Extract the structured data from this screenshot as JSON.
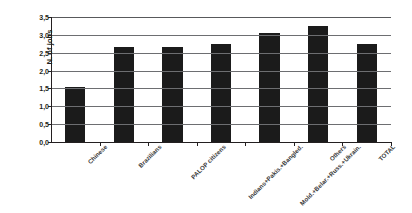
{
  "chart_data": {
    "type": "bar",
    "title": "",
    "xlabel": "",
    "ylabel": "N. of jobs",
    "ylim": [
      0.0,
      3.5
    ],
    "ytick_labels": [
      "0,0",
      "0,5",
      "1,0",
      "1,5",
      "2,0",
      "2,5",
      "3,0",
      "3,5"
    ],
    "ytick_values": [
      0.0,
      0.5,
      1.0,
      1.5,
      2.0,
      2.5,
      3.0,
      3.5
    ],
    "grid": true,
    "legend": "none",
    "bar_color": "#1b1b1b",
    "categories": [
      "Chinese",
      "Brazilians",
      "PALOP citizens",
      "Indians+Pakis.+Bangled.",
      "Mold.+Belar.+Russ.+Ukrain.",
      "Others",
      "TOTAL"
    ],
    "values": [
      1.55,
      2.67,
      2.67,
      2.75,
      3.05,
      3.25,
      2.75
    ]
  },
  "axis": {
    "y_title": "N. of jobs"
  }
}
